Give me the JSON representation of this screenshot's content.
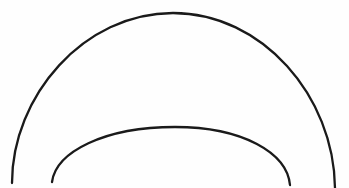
{
  "figure": {
    "canvas": {
      "width": 349,
      "height": 188,
      "background_color": "#fefefe"
    },
    "stroke": {
      "color": "#1a1a1a",
      "outer_width": 2.3,
      "inner_width": 2.3,
      "linecap": "round",
      "fill": "none"
    }
  },
  "chart_data": {
    "type": "line",
    "subtitle": "",
    "xlabel": "",
    "ylabel": "",
    "grid": false,
    "legend_position": "none",
    "axis_visible": false,
    "tick_labels_visible": false,
    "xlim": [
      0,
      349
    ],
    "ylim": [
      188,
      0
    ],
    "coordinate_note": "Pixel coordinates with origin at top-left of the 349x188 frame; y increases downward.",
    "series": [
      {
        "name": "outer-arc",
        "kind": "elliptical-arc",
        "stroke_color": "#1a1a1a",
        "stroke_width": 2.3,
        "center": [
          173,
          188
        ],
        "radius_x": 162,
        "radius_y": 175,
        "start_point": [
          12,
          183
        ],
        "apex_point": [
          173,
          13
        ],
        "end_point": [
          335,
          188
        ],
        "sweep_degrees": 178,
        "path": "M 12 183 C 12 96, 84 13, 173 13 C 262 13, 334 96, 335 188",
        "sample_points": [
          [
            12,
            183
          ],
          [
            18,
            140
          ],
          [
            25,
            90
          ],
          [
            38,
            60
          ],
          [
            57,
            38
          ],
          [
            85,
            23
          ],
          [
            120,
            16
          ],
          [
            173,
            13
          ],
          [
            226,
            16
          ],
          [
            261,
            24
          ],
          [
            289,
            39
          ],
          [
            305,
            62
          ],
          [
            318,
            92
          ],
          [
            328,
            136
          ],
          [
            335,
            188
          ]
        ]
      },
      {
        "name": "inner-arc",
        "kind": "elliptical-arc",
        "stroke_color": "#1a1a1a",
        "stroke_width": 2.3,
        "center": [
          172,
          195
        ],
        "radius_x": 120,
        "radius_y": 68,
        "start_point": [
          52,
          182
        ],
        "apex_point": [
          175,
          127
        ],
        "end_point": [
          290,
          185
        ],
        "sweep_degrees": 170,
        "path": "M 52 182 C 56 152, 104 127, 175 127 C 243 127, 287 153, 290 185",
        "sample_points": [
          [
            52,
            182
          ],
          [
            62,
            166
          ],
          [
            80,
            150
          ],
          [
            104,
            137
          ],
          [
            138,
            129
          ],
          [
            175,
            127
          ],
          [
            212,
            130
          ],
          [
            244,
            138
          ],
          [
            266,
            150
          ],
          [
            281,
            166
          ],
          [
            290,
            185
          ]
        ]
      }
    ]
  }
}
